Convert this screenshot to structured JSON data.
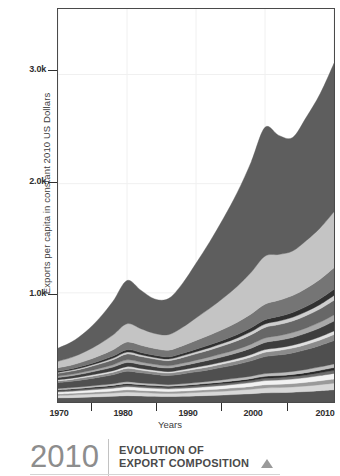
{
  "chart_data": {
    "type": "area",
    "title": "",
    "subtitle": "",
    "xlabel": "Years",
    "ylabel": "Exports per capita in constant 2010 US Dollars",
    "xlim": [
      1970,
      2010
    ],
    "ylim": [
      0,
      3600
    ],
    "xticks": [
      1970,
      1980,
      1990,
      2000,
      2010
    ],
    "xtick_labels": [
      "1970",
      "1980",
      "1990",
      "2000",
      "2010"
    ],
    "yticks": [
      1000,
      2000,
      3000
    ],
    "ytick_labels": [
      "1.0k",
      "2.0k",
      "3.0k"
    ],
    "grid": "vertical-faint",
    "legend": "none",
    "stacked": true,
    "x": [
      1970,
      1972,
      1974,
      1976,
      1978,
      1980,
      1982,
      1984,
      1986,
      1988,
      1990,
      1992,
      1994,
      1996,
      1998,
      2000,
      2002,
      2004,
      2006,
      2008,
      2010
    ],
    "series": [
      {
        "name": "layer-01",
        "color": "#555555",
        "values": [
          38,
          40,
          44,
          48,
          52,
          58,
          55,
          52,
          50,
          52,
          56,
          60,
          64,
          70,
          76,
          84,
          86,
          90,
          96,
          104,
          112
        ]
      },
      {
        "name": "layer-02",
        "color": "#d8d8d8",
        "values": [
          22,
          24,
          26,
          28,
          30,
          33,
          31,
          29,
          28,
          29,
          31,
          33,
          35,
          38,
          41,
          45,
          46,
          48,
          51,
          55,
          60
        ]
      },
      {
        "name": "layer-03",
        "color": "#9a9a9a",
        "values": [
          14,
          15,
          16,
          17,
          19,
          21,
          20,
          19,
          18,
          19,
          20,
          21,
          23,
          24,
          26,
          29,
          30,
          31,
          33,
          36,
          39
        ]
      },
      {
        "name": "layer-04",
        "color": "#f2f2f2",
        "values": [
          18,
          19,
          21,
          23,
          25,
          28,
          26,
          25,
          24,
          25,
          26,
          28,
          30,
          32,
          35,
          38,
          39,
          41,
          44,
          47,
          51
        ]
      },
      {
        "name": "layer-05",
        "color": "#6e6e6e",
        "values": [
          10,
          11,
          12,
          13,
          14,
          15,
          14,
          14,
          13,
          14,
          15,
          16,
          17,
          18,
          19,
          21,
          22,
          23,
          24,
          26,
          28
        ]
      },
      {
        "name": "layer-06",
        "color": "#2a2a2a",
        "values": [
          9,
          10,
          10,
          11,
          12,
          13,
          12,
          12,
          11,
          12,
          13,
          14,
          15,
          16,
          17,
          18,
          19,
          20,
          21,
          23,
          25
        ]
      },
      {
        "name": "layer-07",
        "color": "#bdbdbd",
        "values": [
          12,
          13,
          14,
          15,
          16,
          18,
          17,
          16,
          15,
          16,
          17,
          18,
          20,
          21,
          23,
          25,
          26,
          27,
          29,
          31,
          34
        ]
      },
      {
        "name": "layer-08",
        "color": "#4f4f4f",
        "values": [
          55,
          58,
          64,
          72,
          82,
          96,
          92,
          86,
          84,
          90,
          98,
          106,
          116,
          126,
          140,
          156,
          162,
          170,
          182,
          196,
          214
        ]
      },
      {
        "name": "layer-09",
        "color": "#8b8b8b",
        "values": [
          16,
          17,
          19,
          21,
          23,
          26,
          25,
          23,
          22,
          24,
          26,
          28,
          30,
          33,
          36,
          40,
          42,
          44,
          47,
          50,
          55
        ]
      },
      {
        "name": "layer-10",
        "color": "#e0e0e0",
        "values": [
          10,
          11,
          12,
          13,
          14,
          16,
          15,
          14,
          13,
          14,
          16,
          17,
          18,
          20,
          22,
          24,
          25,
          26,
          28,
          30,
          33
        ]
      },
      {
        "name": "layer-11",
        "color": "#3d3d3d",
        "values": [
          20,
          22,
          25,
          29,
          33,
          38,
          36,
          34,
          33,
          36,
          40,
          44,
          48,
          53,
          58,
          65,
          68,
          71,
          76,
          82,
          90
        ]
      },
      {
        "name": "layer-12",
        "color": "#a8a8a8",
        "values": [
          13,
          14,
          16,
          18,
          21,
          24,
          23,
          21,
          21,
          23,
          25,
          28,
          30,
          33,
          37,
          41,
          43,
          45,
          48,
          52,
          57
        ]
      },
      {
        "name": "layer-13",
        "color": "#676767",
        "values": [
          26,
          29,
          33,
          39,
          46,
          54,
          51,
          48,
          47,
          52,
          58,
          64,
          71,
          78,
          87,
          97,
          101,
          106,
          113,
          122,
          134
        ]
      },
      {
        "name": "layer-14",
        "color": "#cfcfcf",
        "values": [
          9,
          10,
          11,
          13,
          15,
          17,
          16,
          15,
          15,
          17,
          19,
          21,
          23,
          25,
          28,
          31,
          33,
          34,
          37,
          40,
          44
        ]
      },
      {
        "name": "layer-15",
        "color": "#303030",
        "values": [
          11,
          12,
          14,
          16,
          19,
          22,
          21,
          20,
          19,
          21,
          24,
          26,
          29,
          32,
          36,
          40,
          42,
          44,
          47,
          51,
          56
        ]
      },
      {
        "name": "layer-16",
        "color": "#757575",
        "values": [
          30,
          34,
          40,
          48,
          58,
          70,
          66,
          62,
          62,
          70,
          80,
          90,
          100,
          112,
          126,
          142,
          148,
          155,
          166,
          180,
          198
        ]
      },
      {
        "name": "layer-17",
        "color": "#c4c4c4",
        "values": [
          60,
          70,
          86,
          108,
          136,
          168,
          152,
          138,
          142,
          168,
          206,
          244,
          286,
          330,
          382,
          440,
          420,
          408,
          438,
          470,
          512
        ]
      },
      {
        "name": "layer-18",
        "color": "#5e5e5e",
        "values": [
          120,
          142,
          180,
          236,
          310,
          396,
          352,
          316,
          330,
          400,
          500,
          610,
          730,
          860,
          1010,
          1180,
          1090,
          1040,
          1130,
          1230,
          1360
        ]
      }
    ],
    "annotations": [
      {
        "text": "peak near 2000",
        "x": 2000,
        "y": 3520
      },
      {
        "text": "dip near 2005",
        "x": 2005,
        "y": 3180
      },
      {
        "text": "rise to 2010",
        "x": 2010,
        "y": 3470
      }
    ]
  },
  "axes": {
    "y_title": "Exports per capita in constant 2010 US Dollars",
    "x_title": "Years",
    "y_ticks": [
      {
        "label": "3.0k",
        "top": 64
      },
      {
        "label": "2.0k",
        "top": 176
      },
      {
        "label": "1.0k",
        "top": 288
      }
    ],
    "x_ticks": [
      {
        "label": "1970",
        "left": 59
      },
      {
        "label": "1980",
        "left": 123
      },
      {
        "label": "1990",
        "left": 188
      },
      {
        "label": "2000",
        "left": 253
      },
      {
        "label": "2010",
        "left": 325
      }
    ],
    "x_tick_marks": [
      91,
      156,
      221,
      287
    ]
  },
  "caption": {
    "year": "2010",
    "line1": "EVOLUTION OF",
    "line2": "EXPORT COMPOSITION",
    "marker": "triangle-up-icon"
  },
  "colors": {
    "frame": "#4a4a4a",
    "text": "#3a3a3a",
    "caption_year": "#8d8d8d",
    "caption_text": "#4a4a4a",
    "marker": "#9a9a9a",
    "background": "#ffffff",
    "gridline": "#f0f0f0"
  }
}
